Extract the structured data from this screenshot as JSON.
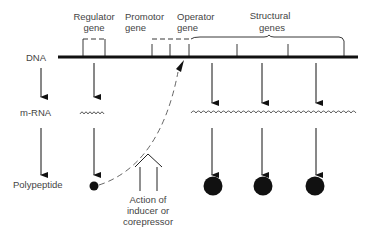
{
  "diagram": {
    "ink_color": "#111111",
    "label_color": "#444444",
    "row_labels": {
      "dna": "DNA",
      "mrna": "m-RNA",
      "polypeptide": "Polypeptide"
    },
    "gene_labels": {
      "regulator": [
        "Regulator",
        "gene"
      ],
      "promotor": [
        "Promotor",
        "gene"
      ],
      "operator": [
        "Operator",
        "gene"
      ],
      "structural": [
        "Structural",
        "genes"
      ]
    },
    "action_label": [
      "Action of",
      "inducer or",
      "corepressor"
    ],
    "structural_gene_count": 3
  }
}
